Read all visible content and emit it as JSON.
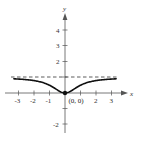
{
  "chart_data": {
    "type": "line",
    "title": "",
    "xlabel": "x",
    "ylabel": "y",
    "xlim": [
      -3.4,
      3.4
    ],
    "ylim": [
      -2.5,
      4.8
    ],
    "grid": false,
    "x_ticks": [
      -3,
      -2,
      -1,
      1,
      2,
      3
    ],
    "x_tick_labels": [
      "-3",
      "-2",
      "-1",
      "",
      "2",
      "3"
    ],
    "y_ticks": [
      4,
      3,
      2,
      1,
      -1,
      -2
    ],
    "y_tick_labels": [
      "4",
      "3",
      "2",
      "",
      "",
      "-2"
    ],
    "series": [
      {
        "name": "f(x) = x^2/(x^2+1)",
        "style": "solid",
        "x": [
          -3.3,
          -3,
          -2.5,
          -2,
          -1.5,
          -1,
          -0.5,
          0,
          0.5,
          1,
          1.5,
          2,
          2.5,
          3,
          3.3
        ],
        "values": [
          0.916,
          0.9,
          0.862,
          0.8,
          0.692,
          0.5,
          0.2,
          0,
          0.2,
          0.5,
          0.692,
          0.8,
          0.862,
          0.9,
          0.916
        ]
      },
      {
        "name": "horizontal asymptote y = 1",
        "style": "dashed",
        "x": [
          -3.4,
          3.4
        ],
        "values": [
          1,
          1
        ]
      }
    ],
    "annotations": [
      {
        "text": "(0, 0)",
        "x": 0,
        "y": 0,
        "marker": "filled-dot"
      }
    ]
  },
  "labels": {
    "x_axis": "x",
    "y_axis": "y",
    "point": "(0, 0)",
    "ticks_x": {
      "n3": "-3",
      "n2": "-2",
      "n1": "-1",
      "p2": "2",
      "p3": "3"
    },
    "ticks_y": {
      "p4": "4",
      "p3": "3",
      "p2": "2",
      "n2": "-2"
    }
  },
  "colors": {
    "curve": "#111111",
    "axis": "#555555",
    "asymptote": "#333333",
    "text": "#333333"
  }
}
